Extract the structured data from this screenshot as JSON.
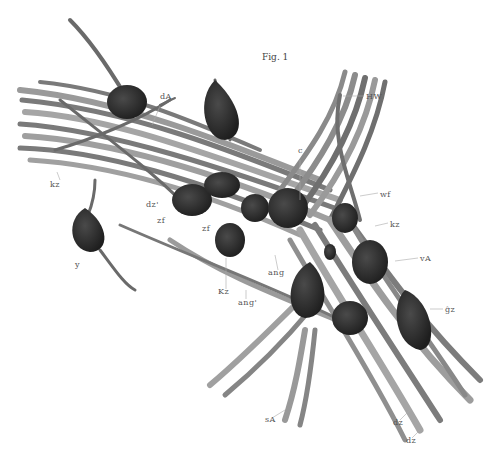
{
  "figure": {
    "title": "Fig. 1",
    "colors": {
      "background": "#ffffff",
      "fiber": "#8a8a8a",
      "fiber_dark": "#4a4a4a",
      "cell": "#2a2a2a",
      "label": "#555555"
    },
    "labels": [
      {
        "id": "HW",
        "text": "HW",
        "x": 366,
        "y": 98
      },
      {
        "id": "dA",
        "text": "dA",
        "x": 160,
        "y": 98
      },
      {
        "id": "kz-left",
        "text": "kz",
        "x": 52,
        "y": 184
      },
      {
        "id": "dz-prime",
        "text": "dz'",
        "x": 146,
        "y": 205
      },
      {
        "id": "c",
        "text": "c",
        "x": 300,
        "y": 152
      },
      {
        "id": "wf",
        "text": "wf",
        "x": 380,
        "y": 196
      },
      {
        "id": "kz-right",
        "text": "kz",
        "x": 390,
        "y": 226
      },
      {
        "id": "zf-1",
        "text": "zf",
        "x": 157,
        "y": 221
      },
      {
        "id": "zf-2",
        "text": "zf",
        "x": 202,
        "y": 228
      },
      {
        "id": "y",
        "text": "y",
        "x": 75,
        "y": 264
      },
      {
        "id": "vA",
        "text": "vA",
        "x": 420,
        "y": 261
      },
      {
        "id": "ang",
        "text": "ang",
        "x": 270,
        "y": 273
      },
      {
        "id": "Kz",
        "text": "Kz",
        "x": 218,
        "y": 292
      },
      {
        "id": "ang-prime",
        "text": "ang'",
        "x": 238,
        "y": 302
      },
      {
        "id": "gz",
        "text": "ĝz",
        "x": 445,
        "y": 311
      },
      {
        "id": "sA",
        "text": "sA",
        "x": 265,
        "y": 420
      },
      {
        "id": "dz-1",
        "text": "dz",
        "x": 393,
        "y": 423
      },
      {
        "id": "dz-2",
        "text": "dz",
        "x": 406,
        "y": 441
      }
    ]
  }
}
